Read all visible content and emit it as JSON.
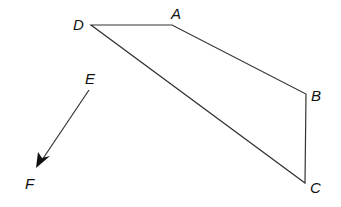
{
  "diagram": {
    "points": {
      "D": {
        "label": "D",
        "x": 91,
        "y": 25,
        "lx": 73,
        "ly": 30
      },
      "A": {
        "label": "A",
        "x": 172,
        "y": 25,
        "lx": 171,
        "ly": 19
      },
      "B": {
        "label": "B",
        "x": 306,
        "y": 94,
        "lx": 311,
        "ly": 101
      },
      "C": {
        "label": "C",
        "x": 305,
        "y": 183,
        "lx": 310,
        "ly": 193
      },
      "E": {
        "label": "E",
        "x": 89,
        "y": 90,
        "lx": 85,
        "ly": 84
      },
      "F": {
        "label": "F",
        "x": 36,
        "y": 168,
        "lx": 25,
        "ly": 189
      }
    },
    "quadrilateral": [
      "D",
      "A",
      "B",
      "C"
    ],
    "vector": {
      "from": "E",
      "to": "F"
    },
    "colors": {
      "stroke": "#333333",
      "text": "#111111"
    }
  }
}
